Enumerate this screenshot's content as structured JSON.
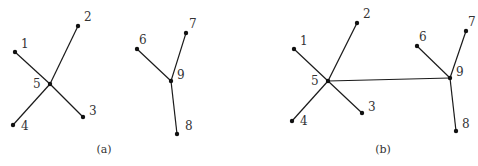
{
  "figure": {
    "panels": [
      {
        "caption": "(a)",
        "caption_pos": [
          104,
          153
        ],
        "nodes": [
          {
            "id": "1",
            "x": 15,
            "y": 52,
            "lx": 21,
            "ly": 48
          },
          {
            "id": "2",
            "x": 78,
            "y": 26,
            "lx": 84,
            "ly": 21
          },
          {
            "id": "3",
            "x": 83,
            "y": 117,
            "lx": 89,
            "ly": 115
          },
          {
            "id": "4",
            "x": 13,
            "y": 125,
            "lx": 21,
            "ly": 130
          },
          {
            "id": "5",
            "x": 50,
            "y": 84,
            "lx": 33,
            "ly": 88
          },
          {
            "id": "6",
            "x": 137,
            "y": 49,
            "lx": 139,
            "ly": 44
          },
          {
            "id": "7",
            "x": 186,
            "y": 33,
            "lx": 189,
            "ly": 28
          },
          {
            "id": "8",
            "x": 177,
            "y": 134,
            "lx": 185,
            "ly": 130
          },
          {
            "id": "9",
            "x": 171,
            "y": 81,
            "lx": 177,
            "ly": 79
          }
        ],
        "edges": [
          [
            "1",
            "5"
          ],
          [
            "2",
            "5"
          ],
          [
            "3",
            "5"
          ],
          [
            "4",
            "5"
          ],
          [
            "6",
            "9"
          ],
          [
            "7",
            "9"
          ],
          [
            "8",
            "9"
          ]
        ]
      },
      {
        "caption": "(b)",
        "caption_pos": [
          383,
          153
        ],
        "nodes": [
          {
            "id": "1",
            "x": 294,
            "y": 49,
            "lx": 300,
            "ly": 45
          },
          {
            "id": "2",
            "x": 357,
            "y": 23,
            "lx": 363,
            "ly": 18
          },
          {
            "id": "3",
            "x": 362,
            "y": 113,
            "lx": 368,
            "ly": 111
          },
          {
            "id": "4",
            "x": 292,
            "y": 121,
            "lx": 300,
            "ly": 125
          },
          {
            "id": "5",
            "x": 328,
            "y": 81,
            "lx": 311,
            "ly": 85
          },
          {
            "id": "6",
            "x": 417,
            "y": 46,
            "lx": 419,
            "ly": 41
          },
          {
            "id": "7",
            "x": 466,
            "y": 31,
            "lx": 468,
            "ly": 26
          },
          {
            "id": "8",
            "x": 456,
            "y": 131,
            "lx": 462,
            "ly": 128
          },
          {
            "id": "9",
            "x": 450,
            "y": 78,
            "lx": 456,
            "ly": 76
          }
        ],
        "edges": [
          [
            "1",
            "5"
          ],
          [
            "2",
            "5"
          ],
          [
            "3",
            "5"
          ],
          [
            "4",
            "5"
          ],
          [
            "6",
            "9"
          ],
          [
            "7",
            "9"
          ],
          [
            "8",
            "9"
          ],
          [
            "5",
            "9"
          ]
        ]
      }
    ]
  }
}
